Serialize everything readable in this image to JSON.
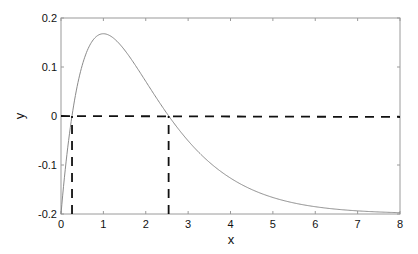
{
  "chart_data": {
    "type": "line",
    "title": "",
    "xlabel": "x",
    "ylabel": "y",
    "xlim": [
      0,
      8
    ],
    "ylim": [
      -0.2,
      0.2
    ],
    "xticks": [
      0,
      1,
      2,
      3,
      4,
      5,
      6,
      7,
      8
    ],
    "yticks": [
      -0.2,
      -0.1,
      0,
      0.1,
      0.2
    ],
    "xtick_labels": [
      "0",
      "1",
      "2",
      "3",
      "4",
      "5",
      "6",
      "7",
      "8"
    ],
    "ytick_labels": [
      "-0.2",
      "-0.1",
      "0",
      "0.1",
      "0.2"
    ],
    "grid": false,
    "legend": null,
    "series": [
      {
        "name": "y(x)",
        "style": "solid",
        "color": "#8a8a8a",
        "x": [
          0,
          0.1,
          0.2,
          0.26,
          0.4,
          0.6,
          0.8,
          1.0,
          1.2,
          1.5,
          2.0,
          2.5,
          3.0,
          3.5,
          4.0,
          4.5,
          5.0,
          5.5,
          6.0,
          6.5,
          7.0,
          7.5,
          8.0
        ],
        "y": [
          -0.2,
          -0.11,
          -0.036,
          0.0,
          0.068,
          0.129,
          0.159,
          0.168,
          0.161,
          0.135,
          0.071,
          0.005,
          -0.051,
          -0.094,
          -0.127,
          -0.15,
          -0.166,
          -0.178,
          -0.185,
          -0.19,
          -0.194,
          -0.196,
          -0.197
        ]
      },
      {
        "name": "zero-line",
        "style": "dashed",
        "color": "#111111",
        "x": [
          0,
          8
        ],
        "y": [
          0,
          -0.002
        ]
      },
      {
        "name": "root-1-marker",
        "style": "dashed",
        "color": "#111111",
        "x": [
          0.26,
          0.26
        ],
        "y": [
          -0.2,
          0
        ]
      },
      {
        "name": "root-2-marker",
        "style": "dashed",
        "color": "#111111",
        "x": [
          2.54,
          2.54
        ],
        "y": [
          -0.2,
          0
        ]
      }
    ],
    "annotations": {
      "roots": [
        0.26,
        2.54
      ],
      "peak": {
        "x": 1.0,
        "y": 0.168
      }
    }
  },
  "labels": {
    "xlabel": "x",
    "ylabel": "y"
  },
  "colors": {
    "curve": "#8a8a8a",
    "dashed": "#111111",
    "axis": "#9a9a9a",
    "text": "#111111"
  }
}
